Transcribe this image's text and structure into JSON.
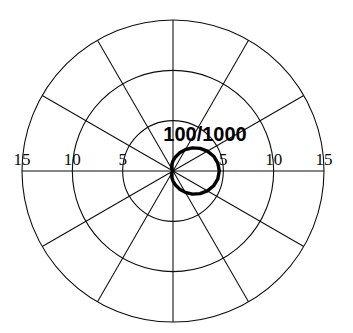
{
  "figure": {
    "kind": "polar-radiation-pattern",
    "background_color": "#ffffff",
    "line_color": "#0d0d0d",
    "trace_color": "#000000",
    "center_label": "100/1000"
  },
  "axis": {
    "left_ticks": [
      "15",
      "10",
      "5"
    ],
    "right_ticks": [
      "5",
      "10",
      "15"
    ]
  },
  "chart_data": {
    "type": "line",
    "subtype": "polar",
    "title": "",
    "subtitle": "",
    "xlabel": "",
    "ylabel": "",
    "annotations": [
      {
        "text": "100/1000",
        "r": 0,
        "theta_deg": 90,
        "placement": "above-center"
      }
    ],
    "grid": true,
    "grid_circles_r": [
      5,
      10,
      15
    ],
    "radial_tick_labels": [
      "5",
      "10",
      "15"
    ],
    "radial_tick_labels_left": [
      "15",
      "10",
      "5"
    ],
    "radial_tick_labels_right": [
      "5",
      "10",
      "15"
    ],
    "rlim": [
      0,
      15
    ],
    "theta_direction": "counterclockwise",
    "theta_zero_location": "E",
    "spoke_interval_deg": 30,
    "spokes_deg": [
      0,
      30,
      60,
      90,
      120,
      150,
      180,
      210,
      240,
      270,
      300,
      330
    ],
    "legend": null,
    "legend_position": "none",
    "series": [
      {
        "name": "pattern",
        "closed": true,
        "theta_deg": [
          0,
          10,
          20,
          30,
          40,
          50,
          60,
          70,
          80,
          90,
          100,
          110,
          120,
          130,
          140,
          150,
          160,
          170,
          180,
          190,
          200,
          210,
          220,
          230,
          240,
          250,
          260,
          270,
          280,
          290,
          300,
          310,
          320,
          330,
          340,
          350,
          360
        ],
        "r": [
          4.6,
          4.52,
          4.3,
          3.95,
          3.5,
          3.0,
          2.45,
          1.92,
          1.42,
          1.0,
          0.66,
          0.4,
          0.22,
          0.1,
          0.04,
          0.01,
          0.0,
          0.0,
          0.0,
          0.0,
          0.0,
          0.01,
          0.04,
          0.1,
          0.22,
          0.4,
          0.66,
          1.0,
          1.42,
          1.92,
          2.45,
          3.0,
          3.5,
          3.95,
          4.3,
          4.52,
          4.6
        ]
      }
    ]
  },
  "geometry": {
    "center_x": 173,
    "center_y": 171,
    "r15_px": 151,
    "r10_px": 101,
    "r5_px": 50
  }
}
